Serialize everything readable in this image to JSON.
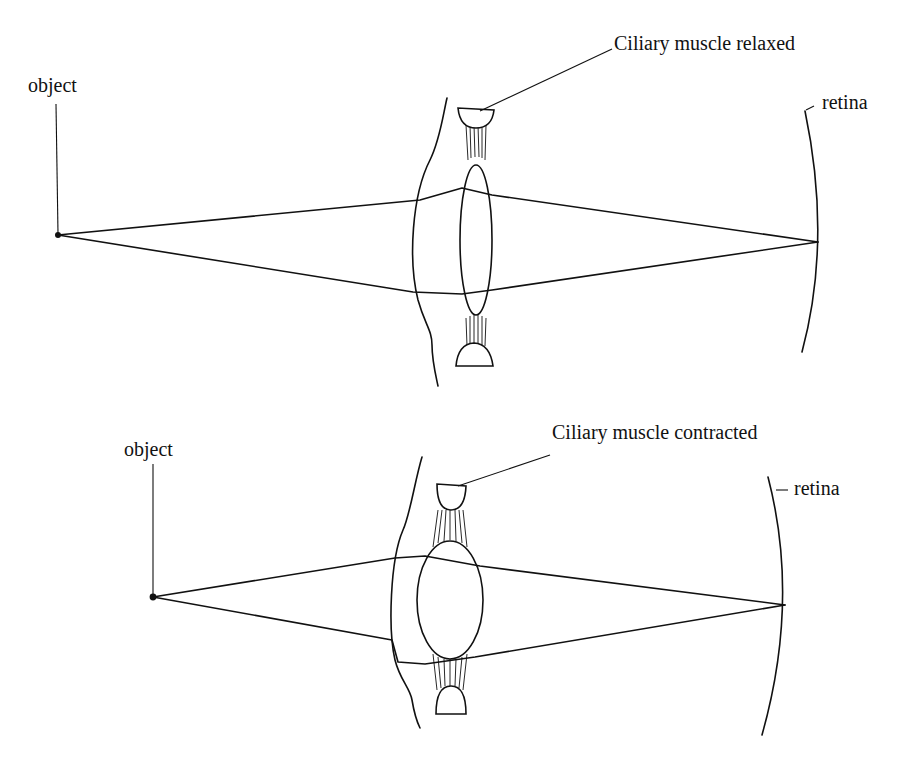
{
  "figure": {
    "colors": {
      "ink": "#111111",
      "background": "#ffffff"
    }
  },
  "panels": [
    {
      "id": "relaxed",
      "object_label": "object",
      "muscle_label": "Ciliary muscle relaxed",
      "retina_label": "retina",
      "lens_shape": "thin (flattened)"
    },
    {
      "id": "contracted",
      "object_label": "object",
      "muscle_label": "Ciliary muscle contracted",
      "retina_label": "retina",
      "lens_shape": "thick (rounded)"
    }
  ]
}
